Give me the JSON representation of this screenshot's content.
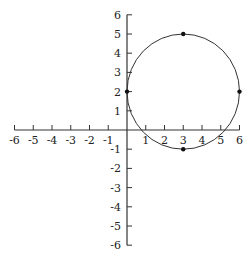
{
  "chart_data": {
    "type": "scatter",
    "title": "",
    "xlabel": "",
    "ylabel": "",
    "xlim": [
      -6,
      6
    ],
    "ylim": [
      -6,
      6
    ],
    "grid": false,
    "x_ticks": [
      -6,
      -5,
      -4,
      -3,
      -2,
      -1,
      1,
      2,
      3,
      4,
      5,
      6
    ],
    "y_ticks": [
      6,
      5,
      4,
      3,
      2,
      1,
      -1,
      -2,
      -3,
      -4,
      -5,
      -6
    ],
    "x_tick_labels": [
      "-6",
      "-5",
      "-4",
      "-3",
      "-2",
      "-1",
      "1",
      "2",
      "3",
      "4",
      "5",
      "6"
    ],
    "y_tick_labels": [
      "6",
      "5",
      "4",
      "3",
      "2",
      "1",
      "-1",
      "-2",
      "-3",
      "-4",
      "-5",
      "-6"
    ],
    "shapes": [
      {
        "type": "circle",
        "center": [
          3,
          2
        ],
        "radius": 3
      }
    ],
    "points": [
      {
        "x": 3,
        "y": 5
      },
      {
        "x": 0,
        "y": 2
      },
      {
        "x": 6,
        "y": 2
      },
      {
        "x": 3,
        "y": -1
      }
    ],
    "colors": {
      "line": "#333333",
      "point": "#111111",
      "axis": "#333333"
    }
  }
}
